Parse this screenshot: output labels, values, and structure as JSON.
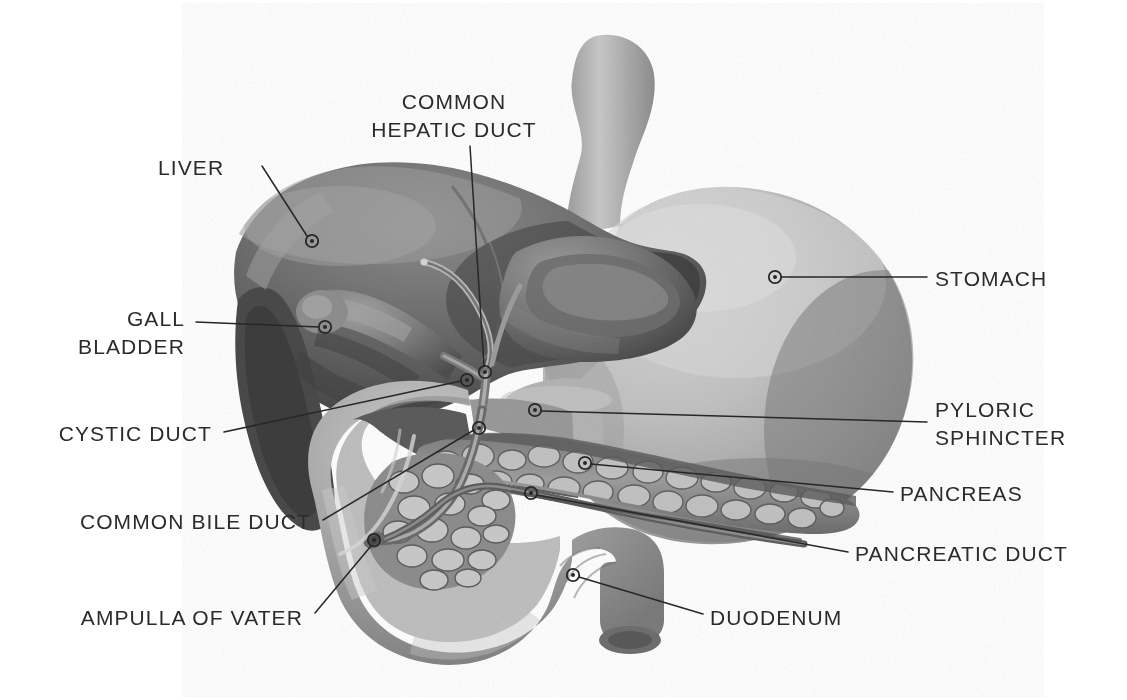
{
  "figure": {
    "style": "grayscale airbrush medical illustration",
    "background_color": "#ffffff",
    "label_color": "#2b2b2b",
    "leader_line_color": "#272727",
    "marker_type": "small-circle-with-center-dot",
    "width": 1127,
    "height": 700
  },
  "labels": [
    {
      "id": "liver",
      "name": "LIVER",
      "lines": [
        "LIVER"
      ],
      "align": "left",
      "text_x": 158,
      "text_y": 154,
      "marker_x": 312,
      "marker_y": 241,
      "leader": "M262,166 L307,236"
    },
    {
      "id": "common-hepatic-duct",
      "name": "COMMON HEPATIC DUCT",
      "lines": [
        "COMMON",
        "HEPATIC DUCT"
      ],
      "align": "center",
      "text_x": 454,
      "text_y": 88,
      "marker_x": 485,
      "marker_y": 372,
      "leader": "M470,146 L484,366"
    },
    {
      "id": "gall-bladder",
      "name": "GALL BLADDER",
      "lines": [
        "GALL",
        "BLADDER"
      ],
      "align": "right",
      "text_x": 185,
      "text_y": 305,
      "marker_x": 325,
      "marker_y": 327,
      "leader": "M196,322 L319,327"
    },
    {
      "id": "stomach",
      "name": "STOMACH",
      "lines": [
        "STOMACH"
      ],
      "align": "left",
      "text_x": 935,
      "text_y": 265,
      "marker_x": 775,
      "marker_y": 277,
      "leader": "M927,277 L781,277"
    },
    {
      "id": "pyloric-sphincter",
      "name": "PYLORIC SPHINCTER",
      "lines": [
        "PYLORIC",
        "SPHINCTER"
      ],
      "align": "left",
      "text_x": 935,
      "text_y": 396,
      "marker_x": 535,
      "marker_y": 410,
      "leader": "M927,422 L541,411"
    },
    {
      "id": "cystic-duct",
      "name": "CYSTIC DUCT",
      "lines": [
        "CYSTIC DUCT"
      ],
      "align": "right",
      "text_x": 212,
      "text_y": 420,
      "marker_x": 467,
      "marker_y": 380,
      "leader": "M224,432 L461,381"
    },
    {
      "id": "pancreas",
      "name": "PANCREAS",
      "lines": [
        "PANCREAS"
      ],
      "align": "left",
      "text_x": 900,
      "text_y": 480,
      "marker_x": 585,
      "marker_y": 463,
      "leader": "M893,492 L591,464"
    },
    {
      "id": "common-bile-duct",
      "name": "COMMON BILE DUCT",
      "lines": [
        "COMMON BILE DUCT"
      ],
      "align": "right",
      "text_x": 311,
      "text_y": 508,
      "marker_x": 479,
      "marker_y": 428,
      "leader": "M323,520 L474,430"
    },
    {
      "id": "pancreatic-duct",
      "name": "PANCREATIC DUCT",
      "lines": [
        "PANCREATIC DUCT"
      ],
      "align": "left",
      "text_x": 855,
      "text_y": 540,
      "marker_x": 531,
      "marker_y": 493,
      "leader": "M848,552 L537,495"
    },
    {
      "id": "ampulla-of-vater",
      "name": "AMPULLA OF VATER",
      "lines": [
        "AMPULLA OF VATER"
      ],
      "align": "right",
      "text_x": 303,
      "text_y": 604,
      "marker_x": 374,
      "marker_y": 540,
      "leader": "M315,613 L371,546"
    },
    {
      "id": "duodenum",
      "name": "DUODENUM",
      "lines": [
        "DUODENUM"
      ],
      "align": "left",
      "text_x": 710,
      "text_y": 604,
      "marker_x": 573,
      "marker_y": 575,
      "leader": "M703,614 L579,577"
    }
  ],
  "organs": [
    {
      "id": "liver",
      "label": "Liver",
      "tone": "dark-gray"
    },
    {
      "id": "gall-bladder",
      "label": "Gall bladder",
      "tone": "mid-gray"
    },
    {
      "id": "stomach",
      "label": "Stomach",
      "tone": "light-gray"
    },
    {
      "id": "duodenum",
      "label": "Duodenum",
      "tone": "mid-gray"
    },
    {
      "id": "pancreas",
      "label": "Pancreas",
      "tone": "textured-lobular-gray"
    },
    {
      "id": "ducts",
      "label": "Biliary ducts",
      "tone": "outlined-gray"
    }
  ]
}
